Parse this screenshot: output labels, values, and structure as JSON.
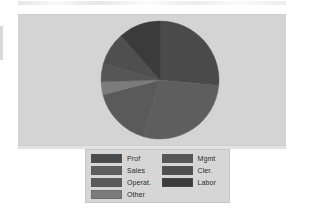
{
  "figure": {
    "panel_background": "#d4d4d4",
    "page_background": "#ffffff",
    "legend_background": "#d6d6d6"
  },
  "legend": {
    "columns": [
      {
        "entries": [
          {
            "label": "Prof",
            "color": "#4a4a4a"
          },
          {
            "label": "Sales",
            "color": "#5e5e5e"
          },
          {
            "label": "Operat.",
            "color": "#5a5a5a"
          },
          {
            "label": "Other",
            "color": "#7b7b7b"
          }
        ]
      },
      {
        "entries": [
          {
            "label": "Mgmt",
            "color": "#565656"
          },
          {
            "label": "Cler.",
            "color": "#4f4f4f"
          },
          {
            "label": "Labor",
            "color": "#3b3b3b"
          }
        ]
      }
    ]
  },
  "chart_data": {
    "type": "pie",
    "title": "",
    "subtitle": "",
    "xlabel": "",
    "ylabel": "",
    "grid": false,
    "legend_position": "bottom",
    "start_angle_deg": 0,
    "direction": "clockwise",
    "center": {
      "cx": 60,
      "cy": 60,
      "r": 59
    },
    "categories": [
      "Prof",
      "Sales",
      "Operat.",
      "Other",
      "Mgmt",
      "Cler.",
      "Labor"
    ],
    "values": [
      26.5,
      28.0,
      16.5,
      3.5,
      5.0,
      9.0,
      11.5
    ],
    "units": "percent",
    "slices": [
      {
        "label": "Prof",
        "value": 26.5,
        "angle_deg": 95.4,
        "start_deg": 0.0,
        "end_deg": 95.4,
        "color": "#4a4a4a"
      },
      {
        "label": "Sales",
        "value": 28.0,
        "angle_deg": 100.8,
        "start_deg": 95.4,
        "end_deg": 196.2,
        "color": "#5e5e5e"
      },
      {
        "label": "Operat.",
        "value": 16.5,
        "angle_deg": 59.4,
        "start_deg": 196.2,
        "end_deg": 255.6,
        "color": "#5a5a5a"
      },
      {
        "label": "Other",
        "value": 3.5,
        "angle_deg": 12.6,
        "start_deg": 255.6,
        "end_deg": 268.2,
        "color": "#7b7b7b"
      },
      {
        "label": "Mgmt",
        "value": 5.0,
        "angle_deg": 18.0,
        "start_deg": 268.2,
        "end_deg": 286.2,
        "color": "#565656"
      },
      {
        "label": "Cler.",
        "value": 9.0,
        "angle_deg": 32.4,
        "start_deg": 286.2,
        "end_deg": 318.6,
        "color": "#4f4f4f"
      },
      {
        "label": "Labor",
        "value": 11.5,
        "angle_deg": 41.4,
        "start_deg": 318.6,
        "end_deg": 360.0,
        "color": "#3b3b3b"
      }
    ]
  }
}
